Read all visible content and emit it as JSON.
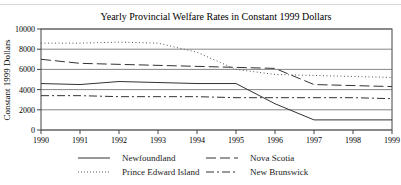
{
  "chart_data": {
    "type": "line",
    "title": "Yearly Provincial Welfare Rates in Constant 1999 Dollars",
    "xlabel": "",
    "ylabel": "Constant 1999 Dollars",
    "x": [
      1990,
      1991,
      1992,
      1993,
      1994,
      1995,
      1996,
      1997,
      1998,
      1999
    ],
    "ylim": [
      0,
      10000
    ],
    "yticks": [
      0,
      2000,
      4000,
      6000,
      8000,
      10000
    ],
    "grid": "horizontal",
    "legend_position": "bottom",
    "series": [
      {
        "name": "Newfoundland",
        "style": "solid",
        "values": [
          4600,
          4500,
          4800,
          4700,
          4600,
          4600,
          2600,
          1000,
          1000,
          1000
        ]
      },
      {
        "name": "Nova Scotia",
        "style": "dashed",
        "values": [
          7000,
          6600,
          6500,
          6400,
          6300,
          6200,
          6100,
          4500,
          4400,
          4300
        ]
      },
      {
        "name": "Prince Edward Island",
        "style": "dotted",
        "values": [
          8600,
          8600,
          8700,
          8600,
          7700,
          6000,
          5500,
          5400,
          5300,
          5200
        ]
      },
      {
        "name": "New Brunswick",
        "style": "dash-dot",
        "values": [
          3400,
          3400,
          3300,
          3300,
          3300,
          3200,
          3200,
          3200,
          3200,
          3100
        ]
      }
    ]
  }
}
